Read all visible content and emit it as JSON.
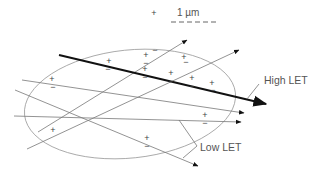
{
  "scale_bar": {
    "label": "1 µm"
  },
  "labels": {
    "high_let": "High LET",
    "low_let": "Low LET"
  },
  "colors": {
    "track_high": "#111111",
    "track_low": "#777777",
    "ellipse": "#999999",
    "text": "#555555"
  },
  "signs": [
    {
      "t": "+",
      "x": 109,
      "y": 61
    },
    {
      "t": "−",
      "x": 108,
      "y": 69
    },
    {
      "t": "+",
      "x": 146,
      "y": 55
    },
    {
      "t": "−",
      "x": 146,
      "y": 63
    },
    {
      "t": "+",
      "x": 154,
      "y": 13
    },
    {
      "t": "−",
      "x": 155,
      "y": 50
    },
    {
      "t": "+",
      "x": 184,
      "y": 57
    },
    {
      "t": "−",
      "x": 186,
      "y": 62
    },
    {
      "t": "+",
      "x": 145,
      "y": 69
    },
    {
      "t": "−",
      "x": 145,
      "y": 77
    },
    {
      "t": "+",
      "x": 171,
      "y": 73
    },
    {
      "t": "−",
      "x": 171,
      "y": 81
    },
    {
      "t": "+",
      "x": 192,
      "y": 78
    },
    {
      "t": "−",
      "x": 192,
      "y": 86
    },
    {
      "t": "+",
      "x": 212,
      "y": 83
    },
    {
      "t": "−",
      "x": 213,
      "y": 90
    },
    {
      "t": "+",
      "x": 52,
      "y": 79
    },
    {
      "t": "−",
      "x": 53,
      "y": 87
    },
    {
      "t": "+",
      "x": 205,
      "y": 115
    },
    {
      "t": "−",
      "x": 205,
      "y": 123
    },
    {
      "t": "+",
      "x": 53,
      "y": 130
    },
    {
      "t": "+",
      "x": 147,
      "y": 138
    },
    {
      "t": "−",
      "x": 147,
      "y": 146
    }
  ]
}
